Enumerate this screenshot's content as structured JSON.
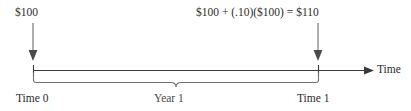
{
  "diagram": {
    "type": "financial-timeline",
    "title_visible": false,
    "axis": {
      "label": "Time",
      "line_color": "#3a3a3a",
      "arrow_direction": "right"
    },
    "labels": {
      "present_value": "$100",
      "future_value_formula": "$100 + (.10)($100) = $110",
      "time_start": "Time 0",
      "time_end": "Time 1",
      "period": "Year 1"
    },
    "markers": [
      {
        "name": "time-0",
        "tick_label": "Time 0",
        "value_label": "$100",
        "x_fraction": 0.08
      },
      {
        "name": "time-1",
        "tick_label": "Time 1",
        "value_label": "$100 + (.10)($100) = $110",
        "x_fraction": 0.774
      }
    ],
    "brace": {
      "label": "Year 1",
      "from": "Time 0",
      "to": "Time 1"
    },
    "colors": {
      "text": "#2b2b2b",
      "muted_text": "#4a4a4a",
      "line": "#3a3a3a",
      "brace_line": "#6e6e6e",
      "arrow": "#555555",
      "background": "#ffffff"
    }
  }
}
